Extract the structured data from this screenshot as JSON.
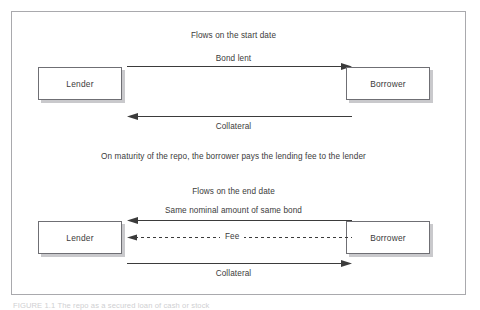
{
  "figure": {
    "caption": "FIGURE 1.1   The repo as a secured loan of cash or stock",
    "frame_color": "#a9a9ad",
    "box_border_color": "#6f6f74",
    "shadow_color": "#c9c9cc",
    "text_color": "#3b3b3b",
    "background": "#ffffff"
  },
  "sections": [
    {
      "id": "start-date",
      "heading": "Flows on the start date",
      "left_party": "Lender",
      "right_party": "Borrower",
      "flows": [
        {
          "id": "bond-lent",
          "label": "Bond lent",
          "direction": "right",
          "style": "solid",
          "label_position": "above"
        },
        {
          "id": "collateral-start",
          "label": "Collateral",
          "direction": "left",
          "style": "solid",
          "label_position": "below"
        }
      ]
    },
    {
      "id": "end-date",
      "heading": "Flows on the end date",
      "left_party": "Lender",
      "right_party": "Borrower",
      "flows": [
        {
          "id": "same-nominal",
          "label": "Same nominal amount of same bond",
          "direction": "left",
          "style": "solid",
          "label_position": "above"
        },
        {
          "id": "fee",
          "label": "Fee",
          "direction": "left",
          "style": "dashed",
          "label_position": "inline"
        },
        {
          "id": "collateral-end",
          "label": "Collateral",
          "direction": "right",
          "style": "solid",
          "label_position": "below"
        }
      ]
    }
  ],
  "maturity_note": "On maturity of the repo, the borrower pays the lending fee to the lender"
}
